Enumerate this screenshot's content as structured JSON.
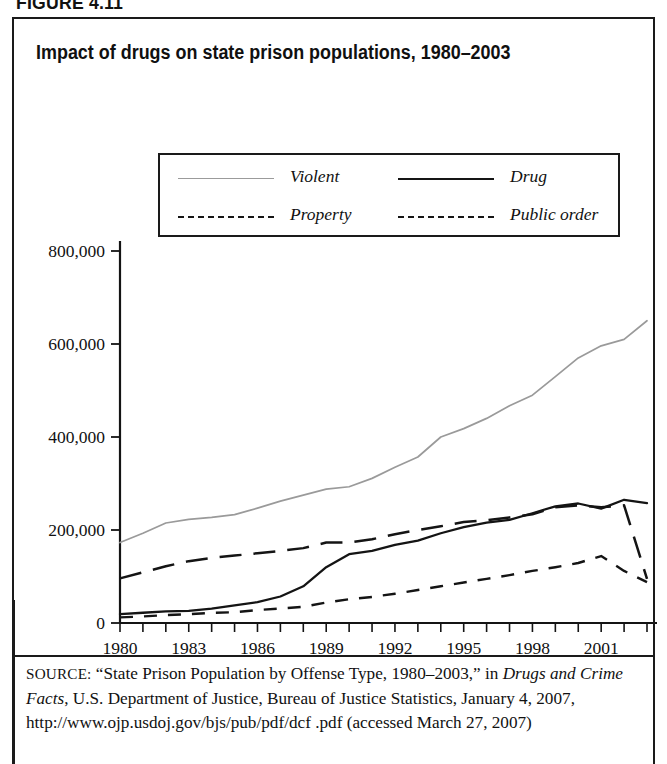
{
  "figure": {
    "number": "FIGURE 4.11",
    "title": "Impact of drugs on state prison populations, 1980–2003"
  },
  "legend": {
    "position": "upper-center-inside-plot",
    "entries": [
      {
        "label": "Violent",
        "icon": "line-solid-thin-gray-icon",
        "color": "#9a9a9a",
        "style": "solid"
      },
      {
        "label": "Drug",
        "icon": "line-solid-thick-icon",
        "color": "#141414",
        "style": "solid"
      },
      {
        "label": "Property",
        "icon": "line-long-dash-icon",
        "color": "#141414",
        "style": "long-dash"
      },
      {
        "label": "Public order",
        "icon": "line-short-dash-icon",
        "color": "#141414",
        "style": "short-dash"
      }
    ]
  },
  "axes": {
    "y_ticks": [
      "0",
      "200,000",
      "400,000",
      "600,000",
      "800,000"
    ],
    "x_ticks": [
      "1980",
      "1983",
      "1986",
      "1989",
      "1992",
      "1995",
      "1998",
      "2001"
    ]
  },
  "source": {
    "label": "SOURCE:",
    "text_1": " “State Prison Population by Offense Type, 1980–2003,” in ",
    "italic_title": "Drugs and Crime Facts",
    "text_2": ", U.S. Department of Justice, Bureau of Justice Statistics, January 4, 2007, http://www.ojp.usdoj.gov/bjs/pub/pdf/dcf .pdf (accessed March 27, 2007)"
  },
  "chart_data": {
    "type": "line",
    "title": "Impact of drugs on state prison populations, 1980–2003",
    "xlabel": "",
    "ylabel": "",
    "xlim": [
      1980,
      2003
    ],
    "ylim": [
      0,
      800000
    ],
    "grid": false,
    "legend_position": "upper-center",
    "x": [
      1980,
      1981,
      1982,
      1983,
      1984,
      1985,
      1986,
      1987,
      1988,
      1989,
      1990,
      1991,
      1992,
      1993,
      1994,
      1995,
      1996,
      1997,
      1998,
      1999,
      2000,
      2001,
      2002,
      2003
    ],
    "series": [
      {
        "name": "Violent",
        "color": "#9a9a9a",
        "style": "solid",
        "values": [
          173000,
          193000,
          215000,
          223000,
          227000,
          233000,
          247000,
          262000,
          275000,
          288000,
          293000,
          311000,
          335000,
          357000,
          400000,
          418000,
          440000,
          467000,
          490000,
          530000,
          570000,
          596000,
          610000,
          650000
        ]
      },
      {
        "name": "Drug",
        "color": "#141414",
        "style": "solid",
        "values": [
          19000,
          22000,
          25000,
          26000,
          31000,
          38000,
          45000,
          57000,
          79000,
          120000,
          148000,
          155000,
          168000,
          177000,
          193000,
          206000,
          216000,
          222000,
          236000,
          251000,
          257000,
          246000,
          265000,
          258000
        ]
      },
      {
        "name": "Property",
        "color": "#141414",
        "style": "long-dash",
        "values": [
          96000,
          109000,
          122000,
          133000,
          140000,
          145000,
          150000,
          155000,
          161000,
          173000,
          173000,
          180000,
          191000,
          200000,
          208000,
          217000,
          221000,
          227000,
          234000,
          249000,
          253000,
          249000,
          253000,
          95000
        ]
      },
      {
        "name": "Public order",
        "color": "#141414",
        "style": "short-dash",
        "values": [
          12000,
          14000,
          17000,
          19000,
          22000,
          23000,
          28000,
          31000,
          35000,
          44000,
          51000,
          56000,
          63000,
          71000,
          79000,
          87000,
          95000,
          103000,
          112000,
          120000,
          129000,
          144000,
          112000,
          88000
        ]
      }
    ]
  }
}
